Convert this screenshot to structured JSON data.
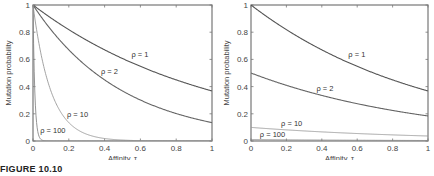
{
  "figure": {
    "caption": "FIGURE 10.10"
  },
  "chart_data": [
    {
      "type": "line",
      "title": "",
      "xlabel": "Affinity, τ",
      "ylabel": "Mutation probability",
      "xlim": [
        0,
        1
      ],
      "ylim": [
        0,
        1
      ],
      "xticks": [
        "0",
        "0.2",
        "0.4",
        "0.6",
        "0.8",
        "1"
      ],
      "yticks": [
        "0",
        "0.2",
        "0.4",
        "0.6",
        "0.8",
        "1"
      ],
      "grid": false,
      "legend": "inline curve labels",
      "formula": "exp(-rho*tau)",
      "x": [
        0,
        0.1,
        0.2,
        0.3,
        0.4,
        0.5,
        0.6,
        0.7,
        0.8,
        0.9,
        1.0
      ],
      "series": [
        {
          "name": "ρ = 1",
          "rho": 1,
          "values": [
            1.0,
            0.905,
            0.819,
            0.741,
            0.67,
            0.607,
            0.549,
            0.497,
            0.449,
            0.407,
            0.368
          ],
          "label_pos": [
            0.55,
            0.62
          ]
        },
        {
          "name": "ρ = 2",
          "rho": 2,
          "values": [
            1.0,
            0.819,
            0.67,
            0.549,
            0.449,
            0.368,
            0.301,
            0.247,
            0.202,
            0.165,
            0.135
          ],
          "label_pos": [
            0.38,
            0.49
          ]
        },
        {
          "name": "ρ = 10",
          "rho": 10,
          "values": [
            1.0,
            0.368,
            0.135,
            0.05,
            0.018,
            0.007,
            0.002,
            0.001,
            0.0,
            0.0,
            0.0
          ],
          "label_pos": [
            0.19,
            0.18
          ]
        },
        {
          "name": "ρ = 100",
          "rho": 100,
          "values": [
            1.0,
            0.0,
            0.0,
            0.0,
            0.0,
            0.0,
            0.0,
            0.0,
            0.0,
            0.0,
            0.0
          ],
          "label_pos": [
            0.04,
            0.06
          ]
        }
      ]
    },
    {
      "type": "line",
      "title": "",
      "xlabel": "Affinity, τ",
      "ylabel": "Mutation probability",
      "xlim": [
        0,
        1
      ],
      "ylim": [
        0,
        1
      ],
      "xticks": [
        "0",
        "0.2",
        "0.4",
        "0.6",
        "0.8",
        "1"
      ],
      "yticks": [
        "0",
        "0.2",
        "0.4",
        "0.6",
        "0.8",
        "1"
      ],
      "grid": false,
      "legend": "inline curve labels",
      "formula": "exp(-tau)/rho",
      "x": [
        0,
        0.1,
        0.2,
        0.3,
        0.4,
        0.5,
        0.6,
        0.7,
        0.8,
        0.9,
        1.0
      ],
      "series": [
        {
          "name": "ρ = 1",
          "rho": 1,
          "values": [
            1.0,
            0.905,
            0.819,
            0.741,
            0.67,
            0.607,
            0.549,
            0.497,
            0.449,
            0.407,
            0.368
          ],
          "label_pos": [
            0.55,
            0.62
          ]
        },
        {
          "name": "ρ = 2",
          "rho": 2,
          "values": [
            0.5,
            0.452,
            0.409,
            0.37,
            0.335,
            0.303,
            0.274,
            0.248,
            0.225,
            0.203,
            0.184
          ],
          "label_pos": [
            0.37,
            0.37
          ]
        },
        {
          "name": "ρ = 10",
          "rho": 10,
          "values": [
            0.1,
            0.09,
            0.082,
            0.074,
            0.067,
            0.061,
            0.055,
            0.05,
            0.045,
            0.041,
            0.037
          ],
          "label_pos": [
            0.17,
            0.11
          ]
        },
        {
          "name": "ρ = 100",
          "rho": 100,
          "values": [
            0.01,
            0.009,
            0.008,
            0.007,
            0.007,
            0.006,
            0.005,
            0.005,
            0.004,
            0.004,
            0.004
          ],
          "label_pos": [
            0.05,
            0.03
          ]
        }
      ]
    }
  ]
}
